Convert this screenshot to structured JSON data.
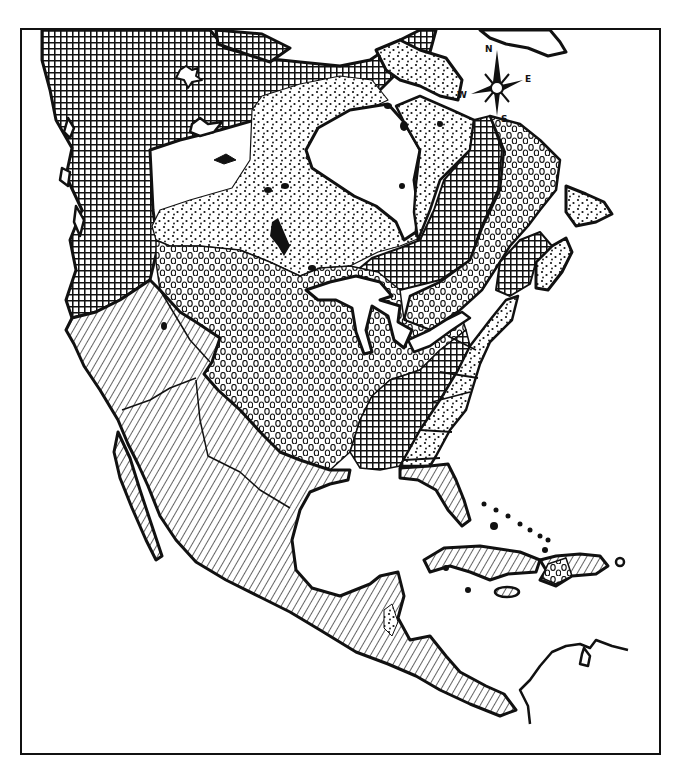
{
  "map": {
    "subject": "North America",
    "style": "black-and-white pattern map",
    "colors": {
      "ink": "#111111",
      "paper": "#ffffff"
    },
    "regions": [
      {
        "id": "region-crosshatch",
        "pattern": "crosshatch-grid",
        "areas": [
          "western Canada and Alaska interior",
          "Pacific Northwest and northern Great Plains",
          "Labrador / northern Quebec",
          "southeastern United States",
          "Maritime region"
        ]
      },
      {
        "id": "region-fine-dots",
        "pattern": "fine-dots",
        "areas": [
          "Hudson Bay lowlands and central Canada",
          "Baffin Island and Arctic islands",
          "Atlantic coastal strip",
          "Newfoundland"
        ]
      },
      {
        "id": "region-circles",
        "pattern": "small-circles",
        "areas": [
          "Great Plains and Midwest",
          "Great Lakes and St. Lawrence valley",
          "Quebec highlands",
          "eastern Cuba / Hispaniola patch"
        ]
      },
      {
        "id": "region-diagonal",
        "pattern": "diagonal-hatching",
        "areas": [
          "California and the Southwest",
          "Mexico",
          "Central America",
          "Florida",
          "Cuba",
          "Hispaniola"
        ]
      }
    ],
    "compass": {
      "north": "N",
      "east": "E",
      "south": "S",
      "west": "W"
    }
  }
}
